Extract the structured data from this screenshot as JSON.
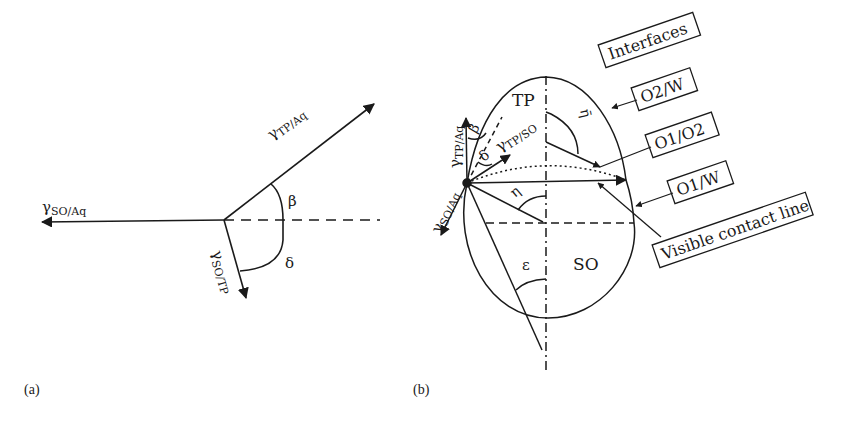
{
  "figure": {
    "panel_a": {
      "label": "(a)",
      "vectors": {
        "so_aq": {
          "symbol": "γ",
          "subscript": "SO/Aq"
        },
        "tp_aq": {
          "symbol": "γ",
          "subscript": "TP/Aq"
        },
        "so_tp": {
          "symbol": "γ",
          "subscript": "SO/TP"
        }
      },
      "angles": {
        "beta": "β",
        "delta": "δ"
      }
    },
    "panel_b": {
      "label": "(b)",
      "regions": {
        "top_phase": "TP",
        "solid_phase": "SO"
      },
      "vectors": {
        "tp_aq": {
          "symbol": "γ",
          "subscript": "TP/Aq"
        },
        "tp_so": {
          "symbol": "γ",
          "subscript": "TP/SO"
        },
        "so_aq": {
          "symbol": "γ",
          "subscript": "SO/Aq"
        }
      },
      "angles": {
        "beta": "β",
        "delta": "δ",
        "eta": "η",
        "eta_bar": "η̄",
        "epsilon": "ε"
      },
      "legend": {
        "title": "Interfaces",
        "items": [
          "O2/W",
          "O1/O2",
          "O1/W",
          "Visible contact line"
        ]
      }
    }
  }
}
